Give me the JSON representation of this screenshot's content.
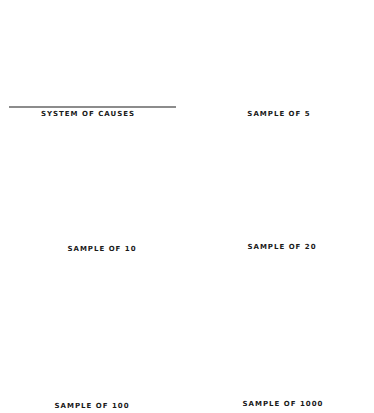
{
  "figure": {
    "panels": [
      {
        "id": "system",
        "label": "SYSTEM OF CAUSES"
      },
      {
        "id": "s5",
        "label": "SAMPLE OF 5"
      },
      {
        "id": "s10",
        "label": "SAMPLE OF 10"
      },
      {
        "id": "s20",
        "label": "SAMPLE OF 20"
      },
      {
        "id": "s100",
        "label": "SAMPLE OF 100"
      },
      {
        "id": "s1000",
        "label": "SAMPLE OF 1000"
      }
    ],
    "ink_color": "#1a1a1a",
    "background": "#ffffff"
  },
  "chart_data": [
    {
      "type": "bar",
      "title": "SYSTEM OF CAUSES",
      "description": "Smooth bell-shaped (normal) frequency distribution drawn as dense vertical lines",
      "x": [
        -4.0,
        -3.8,
        -3.6,
        -3.4,
        -3.2,
        -3.0,
        -2.8,
        -2.6,
        -2.4,
        -2.2,
        -2.0,
        -1.8,
        -1.6,
        -1.4,
        -1.2,
        -1.0,
        -0.8,
        -0.6,
        -0.4,
        -0.2,
        0.0,
        0.2,
        0.4,
        0.6,
        0.8,
        1.0,
        1.2,
        1.4,
        1.6,
        1.8,
        2.0,
        2.2,
        2.4,
        2.6,
        2.8,
        3.0,
        3.2,
        3.4,
        3.6,
        3.8,
        4.0
      ],
      "values": [
        0.03,
        0.04,
        0.06,
        0.09,
        0.13,
        0.18,
        0.25,
        0.34,
        0.45,
        0.56,
        0.67,
        0.78,
        0.88,
        0.96,
        1.04,
        1.12,
        1.2,
        1.28,
        1.34,
        1.38,
        1.4,
        1.38,
        1.34,
        1.28,
        1.2,
        1.12,
        1.04,
        0.96,
        0.88,
        0.78,
        0.67,
        0.56,
        0.45,
        0.34,
        0.25,
        0.18,
        0.13,
        0.09,
        0.06,
        0.04,
        0.03
      ],
      "xlabel": "",
      "ylabel": "",
      "grid": false,
      "legend": null
    },
    {
      "type": "bar",
      "title": "SAMPLE OF 5",
      "x": [
        0.25,
        0.35,
        0.6,
        1.55,
        1.85
      ],
      "values": [
        1,
        1,
        1,
        1,
        1
      ],
      "xlabel": "",
      "ylabel": "",
      "grid": false,
      "legend": null
    },
    {
      "type": "bar",
      "title": "SAMPLE OF 10",
      "x": [
        -0.45,
        -0.35,
        -0.25,
        -0.1,
        0.0,
        1.0,
        1.3
      ],
      "values": [
        1,
        2,
        4,
        1,
        0,
        1,
        1
      ],
      "note": "Tallest bar = 4 observations; adjacent bars 1 and 2; two isolated bars of 1 on the right",
      "xlabel": "",
      "ylabel": "",
      "grid": false,
      "legend": null
    },
    {
      "type": "bar",
      "title": "SAMPLE OF 20",
      "x": [
        -2.6,
        -1.55,
        -1.35,
        -1.25,
        -0.45,
        -0.35,
        -0.2,
        -0.1,
        0.0,
        0.5,
        0.75,
        1.2,
        1.55
      ],
      "values": [
        1,
        1,
        1,
        1,
        1,
        1,
        2,
        5,
        2,
        1,
        1,
        1,
        2
      ],
      "xlabel": "",
      "ylabel": "",
      "grid": false,
      "legend": null
    },
    {
      "type": "bar",
      "title": "SAMPLE OF 100",
      "x": [
        -4.2,
        -2.9,
        -2.7,
        -2.6,
        -2.5,
        -2.2,
        -2.1,
        -1.9,
        -1.8,
        -1.7,
        -1.5,
        -1.4,
        -1.3,
        -1.2,
        -1.1,
        -1.0,
        -0.9,
        -0.8,
        -0.7,
        -0.6,
        -0.5,
        -0.4,
        -0.3,
        -0.2,
        -0.1,
        0.0,
        0.1,
        0.2,
        0.3,
        0.4,
        0.5,
        0.6,
        0.7,
        0.8,
        0.9,
        1.0,
        1.1,
        1.2,
        1.3,
        1.4,
        1.5,
        2.4
      ],
      "values": [
        1,
        1,
        4,
        1,
        1,
        1,
        1,
        4,
        2,
        2,
        6,
        3,
        5,
        4,
        4,
        4,
        3,
        4,
        5,
        6,
        4,
        5,
        5,
        10,
        5,
        1,
        5,
        1,
        3,
        3,
        3,
        3,
        2,
        2,
        2,
        3,
        3,
        1,
        0,
        0,
        1,
        1
      ],
      "xlabel": "",
      "ylabel": "",
      "grid": false,
      "legend": null
    },
    {
      "type": "bar",
      "title": "SAMPLE OF 1000",
      "x": [
        -3.4,
        -3.3,
        -3.2,
        -3.1,
        -3.0,
        -2.9,
        -2.8,
        -2.7,
        -2.6,
        -2.5,
        -2.4,
        -2.3,
        -2.2,
        -2.1,
        -2.0,
        -1.9,
        -1.8,
        -1.7,
        -1.6,
        -1.5,
        -1.4,
        -1.3,
        -1.2,
        -1.1,
        -1.0,
        -0.9,
        -0.8,
        -0.7,
        -0.6,
        -0.5,
        -0.4,
        -0.3,
        -0.2,
        -0.1,
        0.0,
        0.1,
        0.2,
        0.3,
        0.4,
        0.5,
        0.6,
        0.7,
        0.8,
        0.9,
        1.0,
        1.1,
        1.2,
        1.3,
        1.4,
        1.5,
        1.6,
        1.7,
        1.8,
        1.9,
        2.0,
        2.1,
        2.2,
        2.3,
        2.4,
        2.5,
        2.7,
        2.8
      ],
      "values": [
        4,
        1,
        2,
        2,
        1,
        4,
        0,
        3,
        1,
        4,
        5,
        6,
        10,
        15,
        7,
        11,
        13,
        12,
        16,
        15,
        22,
        32,
        32,
        26,
        34,
        35,
        33,
        27,
        38,
        38,
        50,
        36,
        40,
        40,
        36,
        38,
        38,
        32,
        33,
        34,
        30,
        31,
        25,
        25,
        27,
        22,
        20,
        18,
        14,
        12,
        15,
        10,
        8,
        10,
        6,
        5,
        4,
        5,
        2,
        2,
        2,
        2
      ],
      "note": "Heights read in relative units from pixel height; shape approximates the bell curve of the system of causes",
      "xlabel": "",
      "ylabel": "",
      "grid": false,
      "legend": null
    }
  ]
}
